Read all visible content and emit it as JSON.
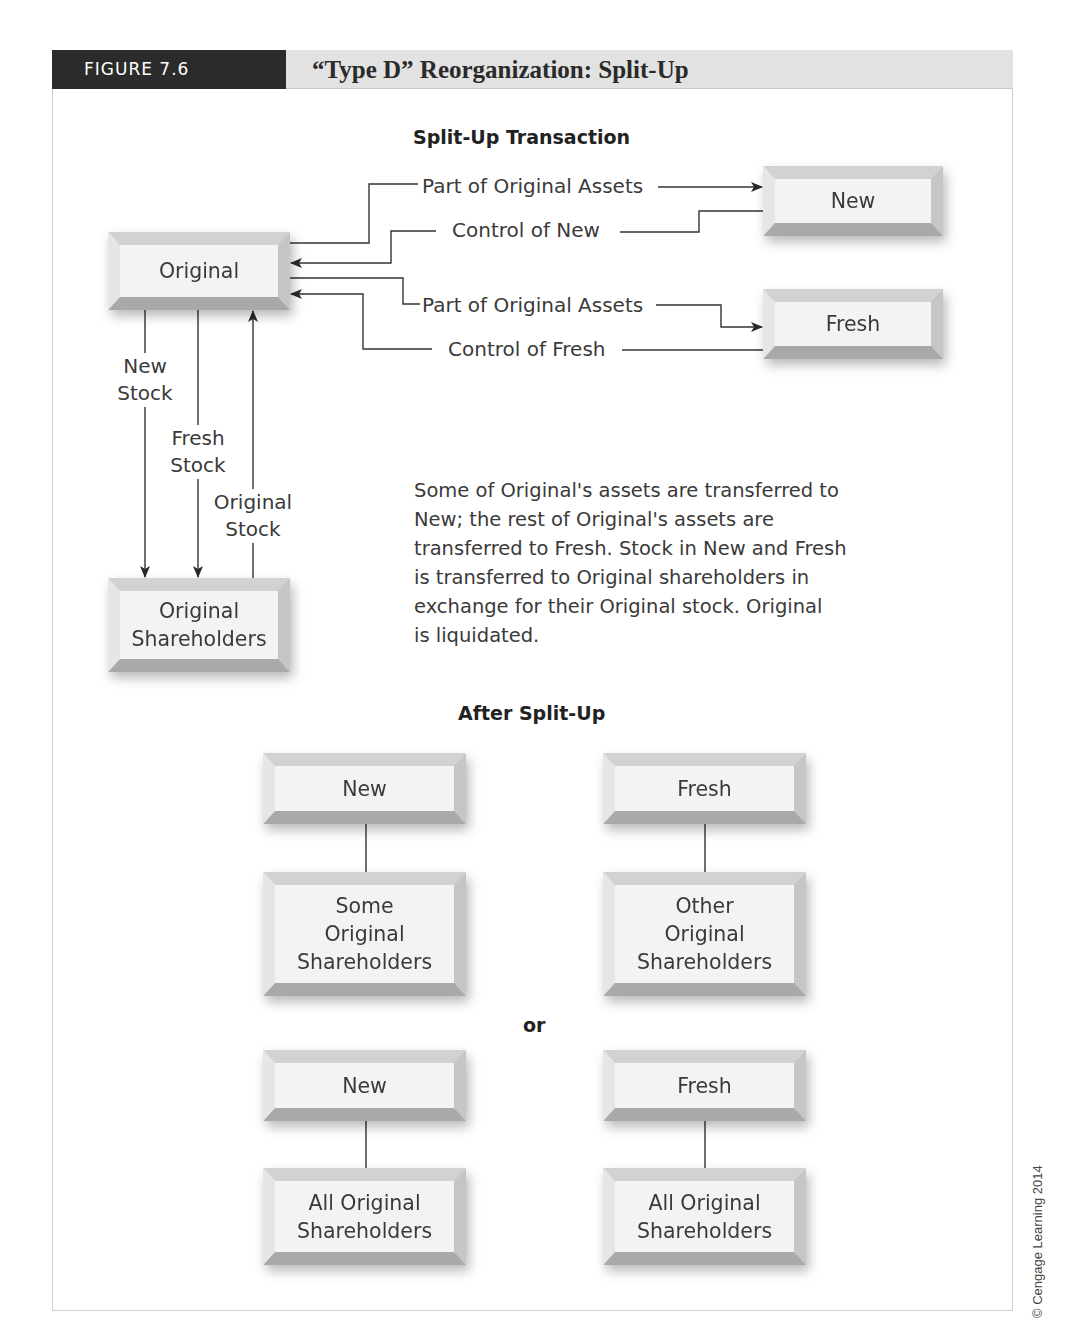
{
  "figure": {
    "label": "FIGURE 7.6",
    "title": "“Type D” Reorganization: Split-Up"
  },
  "transaction": {
    "heading": "Split-Up Transaction",
    "entities": {
      "original": "Original",
      "new": "New",
      "fresh": "Fresh",
      "original_shareholders_line1": "Original",
      "original_shareholders_line2": "Shareholders"
    },
    "flows": {
      "assets_to_new": "Part of Original Assets",
      "control_of_new": "Control of New",
      "assets_to_fresh": "Part of Original Assets",
      "control_of_fresh": "Control of Fresh",
      "new_stock_line1": "New",
      "new_stock_line2": "Stock",
      "fresh_stock_line1": "Fresh",
      "fresh_stock_line2": "Stock",
      "original_stock_line1": "Original",
      "original_stock_line2": "Stock"
    },
    "description": "Some of Original's assets are transferred to New; the rest of Original's assets are transferred to Fresh. Stock in New and Fresh is transferred to Original shareholders in exchange for their Original stock. Original is liquidated.",
    "description_lines": [
      "Some of Original's assets are transferred to",
      "New; the rest of Original's assets are",
      "transferred to Fresh. Stock in New and Fresh",
      "is transferred to Original shareholders in",
      "exchange for their Original stock. Original",
      "is liquidated."
    ]
  },
  "after": {
    "heading": "After Split-Up",
    "separator": "or",
    "option1": {
      "left_top": "New",
      "left_bottom": [
        "Some",
        "Original",
        "Shareholders"
      ],
      "right_top": "Fresh",
      "right_bottom": [
        "Other",
        "Original",
        "Shareholders"
      ]
    },
    "option2": {
      "left_top": "New",
      "left_bottom": [
        "All Original",
        "Shareholders"
      ],
      "right_top": "Fresh",
      "right_bottom": [
        "All Original",
        "Shareholders"
      ]
    }
  },
  "copyright": "© Cengage Learning 2014",
  "colors": {
    "header_dark": "#2b2b2b",
    "header_light": "#e2e2e2",
    "box_face": "#f3f3f3",
    "line": "#333333"
  }
}
